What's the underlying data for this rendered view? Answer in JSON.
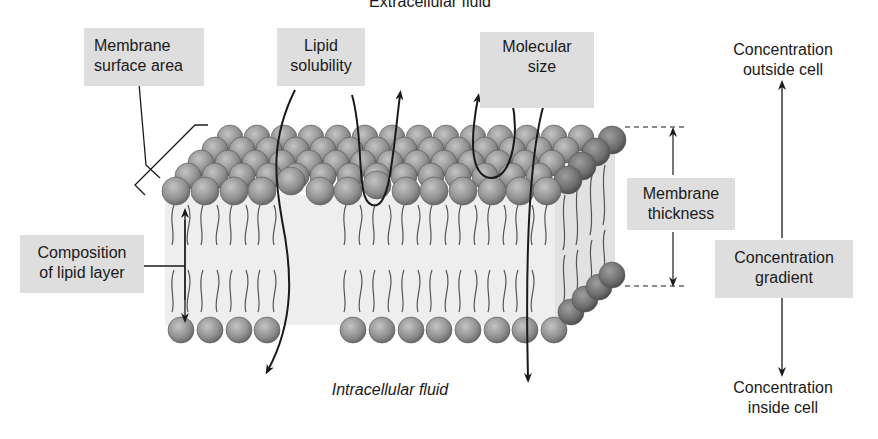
{
  "diagram": {
    "title_top": "Extracellular fluid",
    "title_bottom": "Intracellular fluid",
    "labels": {
      "membrane_surface_area": [
        "Membrane",
        "surface area"
      ],
      "lipid_solubility": [
        "Lipid",
        "solubility"
      ],
      "molecular_size": [
        "Molecular",
        "size"
      ],
      "membrane_thickness": [
        "Membrane",
        "thickness"
      ],
      "composition_lipid_layer": [
        "Composition",
        "of lipid layer"
      ],
      "concentration_outside": [
        "Concentration",
        "outside cell"
      ],
      "concentration_gradient": [
        "Concentration",
        "gradient"
      ],
      "concentration_inside": [
        "Concentration",
        "inside cell"
      ]
    },
    "colors": {
      "label_box": "#dedede",
      "phospholipid_head": "#8f8f8f",
      "membrane_core": "#ececec",
      "line": "#1a1a1a"
    }
  }
}
